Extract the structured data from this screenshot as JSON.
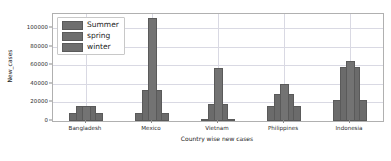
{
  "chart_data": {
    "type": "bar",
    "title": "",
    "xlabel": "Country wise new cases",
    "ylabel": "New_cases",
    "categories": [
      "Bangladesh",
      "Mexico",
      "Vietnam",
      "Philippines",
      "Indonesia"
    ],
    "series": [
      {
        "name": "Summer",
        "values": [
          9000,
          9000,
          1200,
          16000,
          23000
        ],
        "color": "#6b6b6b"
      },
      {
        "name": "spring",
        "values": [
          16000,
          111000,
          57000,
          40000,
          65000
        ],
        "color": "#737373"
      },
      {
        "name": "winter",
        "values": [
          9000,
          9000,
          1200,
          16000,
          23000
        ],
        "color": "#6b6b6b"
      }
    ],
    "extra_tiers": {
      "note": "intermediate step visible between outer and center bar",
      "values": [
        16000,
        33000,
        18000,
        29000,
        58000
      ]
    },
    "yticks": [
      0,
      20000,
      40000,
      60000,
      80000,
      100000
    ],
    "ytick_labels": [
      "0",
      "20000",
      "40000",
      "60000",
      "80000",
      "100000"
    ],
    "ylim": [
      0,
      115000
    ],
    "grid": true,
    "legend_position": "upper left"
  },
  "legend": {
    "entries": [
      {
        "label": "Summer"
      },
      {
        "label": "spring"
      },
      {
        "label": "winter"
      }
    ]
  },
  "axes": {
    "xlabel": "Country wise new cases",
    "ylabel": "New_cases"
  }
}
